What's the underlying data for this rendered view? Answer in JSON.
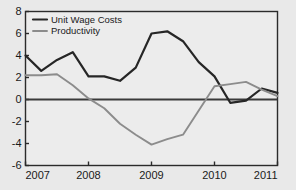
{
  "chart_data": {
    "type": "line",
    "title": "",
    "xlabel": "",
    "ylabel": "",
    "xlim": [
      2007,
      2011
    ],
    "ylim": [
      -6,
      8
    ],
    "xticks": [
      "2007",
      "2008",
      "2009",
      "2010",
      "2011"
    ],
    "yticks": [
      "8",
      "6",
      "4",
      "2",
      "0",
      "-2",
      "-4",
      "-6"
    ],
    "grid": true,
    "legend_position": "top-left",
    "zero_line": 0,
    "x": [
      2007.0,
      2007.25,
      2007.5,
      2007.75,
      2008.0,
      2008.25,
      2008.5,
      2008.75,
      2009.0,
      2009.25,
      2009.5,
      2009.75,
      2010.0,
      2010.25,
      2010.5,
      2010.75,
      2011.0
    ],
    "series": [
      {
        "name": "Unit Wage Costs",
        "color": "#262626",
        "width": 2.2,
        "values": [
          4.0,
          2.6,
          3.6,
          4.3,
          2.1,
          2.1,
          1.7,
          2.9,
          6.0,
          6.2,
          5.3,
          3.4,
          2.1,
          -0.3,
          -0.1,
          1.0,
          0.6
        ]
      },
      {
        "name": "Productivity",
        "color": "#8c8c8c",
        "width": 1.9,
        "values": [
          2.2,
          2.2,
          2.3,
          1.3,
          0.1,
          -0.8,
          -2.2,
          -3.2,
          -4.1,
          -3.6,
          -3.2,
          -1.0,
          1.2,
          1.4,
          1.6,
          0.9,
          0.3
        ]
      }
    ]
  },
  "axes": {
    "y_tick_values": [
      8,
      6,
      4,
      2,
      0,
      -2,
      -4,
      -6
    ],
    "x_tick_values": [
      2007,
      2008,
      2009,
      2010,
      2011
    ]
  }
}
